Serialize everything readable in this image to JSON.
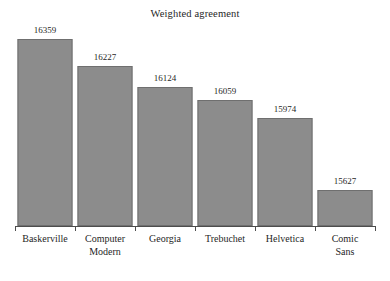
{
  "chart_data": {
    "type": "bar",
    "title": "Weighted agreement",
    "xlabel": "",
    "ylabel": "",
    "categories": [
      "Baskerville",
      "Computer Modern",
      "Georgia",
      "Trebuchet",
      "Helvetica",
      "Comic Sans"
    ],
    "category_lines": [
      [
        "Baskerville"
      ],
      [
        "Computer",
        "Modern"
      ],
      [
        "Georgia"
      ],
      [
        "Trebuchet"
      ],
      [
        "Helvetica"
      ],
      [
        "Comic",
        "Sans"
      ]
    ],
    "values": [
      16359,
      16227,
      16124,
      16059,
      15974,
      15627
    ],
    "value_labels": [
      "16359",
      "16227",
      "16124",
      "16059",
      "15974",
      "15627"
    ],
    "ylim": [
      15450,
      16430
    ],
    "y_axis_visible": false,
    "y_axis_truncated": true,
    "grid": false,
    "legend": null,
    "bar_color": "#8c8c8c",
    "bar_edge_color": "#6f6f6f",
    "axis_color": "#4d4d4d",
    "text_color": "#1f1f1f",
    "background_color": "#ffffff"
  }
}
